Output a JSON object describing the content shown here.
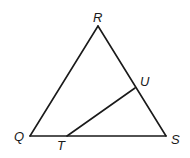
{
  "diagram": {
    "type": "geometry-triangle",
    "points": {
      "R": {
        "label": "R",
        "x": 98,
        "y": 26
      },
      "Q": {
        "label": "Q",
        "x": 30,
        "y": 136
      },
      "S": {
        "label": "S",
        "x": 166,
        "y": 136
      },
      "T": {
        "label": "T",
        "x": 67,
        "y": 136
      },
      "U": {
        "label": "U",
        "x": 135,
        "y": 88
      }
    },
    "segments": [
      "QR",
      "RS",
      "QS",
      "TU"
    ],
    "stroke_color": "#1a1a1a"
  }
}
